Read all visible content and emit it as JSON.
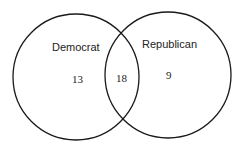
{
  "diagram": {
    "type": "venn",
    "sets": [
      {
        "id": "democrat",
        "label": "Democrat",
        "only_count": "13"
      },
      {
        "id": "republican",
        "label": "Republican",
        "only_count": "9"
      }
    ],
    "intersection": {
      "sets": [
        "democrat",
        "republican"
      ],
      "count": "18"
    },
    "stroke_color": "#1a1a1a"
  }
}
